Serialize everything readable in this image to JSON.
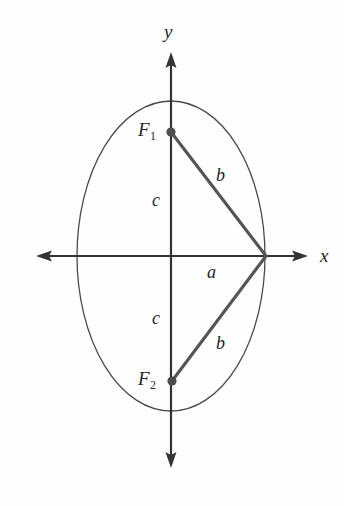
{
  "figure": {
    "kind": "geometry-diagram",
    "background_color": "#fefefe",
    "axis_color": "#333333",
    "curve_color": "#4a4a4a",
    "segment_color": "#555555",
    "point_color": "#4d4d4d",
    "text_color": "#262626"
  },
  "axes": {
    "x_label": "x",
    "y_label": "y",
    "origin": {
      "x": 171,
      "y": 256
    },
    "x_left_tip": 36,
    "x_right_tip": 308,
    "y_top_tip": 52,
    "y_bottom_tip": 468
  },
  "ellipse": {
    "center_x": 171,
    "center_y": 256,
    "semi_axis_x": 94,
    "semi_axis_y": 155
  },
  "points": [
    {
      "name": "focus-upper",
      "label": "F",
      "subscript": "1",
      "x": 171,
      "y": 132
    },
    {
      "name": "focus-lower",
      "label": "F",
      "subscript": "2",
      "x": 172,
      "y": 381
    },
    {
      "name": "vertex-right",
      "label": "",
      "subscript": "",
      "x": 266,
      "y": 256
    }
  ],
  "segments": [
    {
      "name": "b-upper",
      "label": "b",
      "from": "focus-upper",
      "to": "vertex-right",
      "label_x": 216,
      "label_y": 166
    },
    {
      "name": "b-lower",
      "label": "b",
      "from": "vertex-right",
      "to": "focus-lower",
      "label_x": 216,
      "label_y": 334
    },
    {
      "name": "a-semi-major",
      "label": "a",
      "from": "origin",
      "to": "vertex-right",
      "label_x": 207,
      "label_y": 263
    },
    {
      "name": "c-upper",
      "label": "c",
      "from": "origin",
      "to": "focus-upper",
      "label_x": 152,
      "label_y": 191
    },
    {
      "name": "c-lower",
      "label": "c",
      "from": "origin",
      "to": "focus-lower",
      "label_x": 152,
      "label_y": 309
    }
  ],
  "labels": {
    "x_axis": "x",
    "y_axis": "y",
    "a": "a",
    "b_upper": "b",
    "b_lower": "b",
    "c_upper": "c",
    "c_lower": "c",
    "focus1_base": "F",
    "focus1_sub": "1",
    "focus2_base": "F",
    "focus2_sub": "2"
  }
}
